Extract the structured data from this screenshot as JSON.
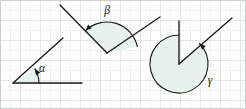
{
  "figure": {
    "width": 246,
    "height": 109,
    "background_color": "#ffffff",
    "grid": {
      "minor_spacing": 10,
      "major_spacing": 20,
      "minor_color": "#eef2ef",
      "major_color": "#e2e9e4"
    },
    "stroke_color": "#1a1a1a",
    "fill_color": "#e6f2ea",
    "label_color": "#111111"
  },
  "angles": [
    {
      "id": "alpha",
      "label": "α",
      "kind": "acute-angle",
      "vertex": {
        "x": 13,
        "y": 83
      },
      "rays": [
        {
          "name": "horizontal-ray",
          "x": 82,
          "y": 83
        },
        {
          "name": "diagonal-ray",
          "x": 63,
          "y": 38
        }
      ],
      "arc_radius": 26,
      "arc_start_deg": 0,
      "arc_end_deg": 33,
      "sweep_deg": 33,
      "arrow_at": "end",
      "label_pos": {
        "x": 42,
        "y": 72
      }
    },
    {
      "id": "beta",
      "label": "β",
      "kind": "obtuse-angle",
      "vertex": {
        "x": 107,
        "y": 53
      },
      "rays": [
        {
          "name": "left-ray",
          "x": 60,
          "y": 5
        },
        {
          "name": "right-ray",
          "x": 160,
          "y": 17
        }
      ],
      "arc_radius": 31,
      "arc_start_deg": 12,
      "arc_end_deg": 134,
      "sweep_deg": 122,
      "arrow_at": "end",
      "label_pos": {
        "x": 107,
        "y": 14
      }
    },
    {
      "id": "gamma",
      "label": "γ",
      "kind": "reflex-angle",
      "vertex": {
        "x": 179,
        "y": 64
      },
      "rays": [
        {
          "name": "vertical-ray",
          "x": 179,
          "y": 21
        },
        {
          "name": "diagonal-ray",
          "x": 232,
          "y": 18
        }
      ],
      "arc_radius": 29,
      "arc_start_deg": 90,
      "arc_end_deg": 45,
      "sweep_deg": 315,
      "arrow_at": "end",
      "label_pos": {
        "x": 210,
        "y": 84
      }
    }
  ]
}
